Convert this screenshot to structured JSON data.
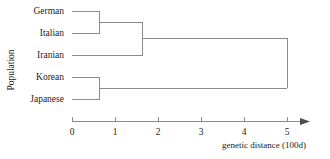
{
  "figure": {
    "type": "dendrogram",
    "width": 330,
    "height": 159,
    "background": "#ffffff",
    "line_color": "#808080"
  },
  "axes": {
    "y_title": "Population",
    "x_title": "genetic distance (100d)",
    "x_ticks": [
      "0",
      "1",
      "2",
      "3",
      "4",
      "5"
    ],
    "x_tick_values": [
      0,
      1,
      2,
      3,
      4,
      5
    ],
    "x_range": [
      0,
      5
    ],
    "x_arrow": true
  },
  "chart_data": {
    "type": "dendrogram",
    "title": "",
    "xlabel": "genetic distance (100d)",
    "ylabel": "Population",
    "xlim": [
      0,
      5.8
    ],
    "grid": false,
    "legend": null,
    "leaves": [
      {
        "label": "German",
        "order": 0,
        "y": 11
      },
      {
        "label": "Italian",
        "order": 1,
        "y": 33
      },
      {
        "label": "Iranian",
        "order": 2,
        "y": 55
      },
      {
        "label": "Korean",
        "order": 3,
        "y": 77
      },
      {
        "label": "Japanese",
        "order": 4,
        "y": 99
      }
    ],
    "merges": [
      {
        "id": "german-italian",
        "children": [
          "German",
          "Italian"
        ],
        "distance": 0.65,
        "y": 22
      },
      {
        "id": "korean-japanese",
        "children": [
          "Korean",
          "Japanese"
        ],
        "distance": 0.65,
        "y": 88
      },
      {
        "id": "west-eurasian",
        "children": [
          "german-italian",
          "Iranian"
        ],
        "distance": 1.65,
        "y": 38
      },
      {
        "id": "root",
        "children": [
          "west-eurasian",
          "korean-japanese"
        ],
        "distance": 5.0,
        "y": 63
      }
    ],
    "x_tick_labels": [
      "0",
      "1",
      "2",
      "3",
      "4",
      "5"
    ],
    "x_tick_values": [
      0,
      1,
      2,
      3,
      4,
      5
    ]
  }
}
